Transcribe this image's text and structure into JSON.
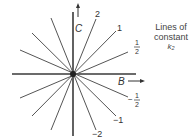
{
  "diagram": {
    "title_lines": [
      "Lines of",
      "constant",
      "k₂"
    ],
    "axes": {
      "horizontal_label": "B",
      "vertical_label": "C"
    },
    "line_labels": {
      "pos_2": "2",
      "pos_1": "1",
      "pos_half_num": "1",
      "pos_half_den": "2",
      "neg_half_sign": "−",
      "neg_half_num": "1",
      "neg_half_den": "2",
      "neg_1": "−1",
      "neg_2": "−2"
    },
    "slopes": [
      "2",
      "1",
      "1/2",
      "-1/2",
      "-1",
      "-2"
    ]
  }
}
